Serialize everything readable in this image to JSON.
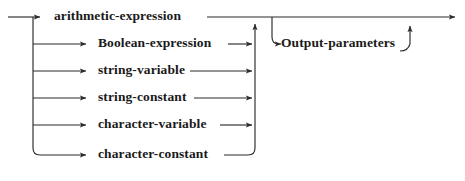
{
  "diagram": {
    "type": "railroad-syntax-diagram",
    "title": "",
    "line_color": "#2b2b2b",
    "text_color": "#1a1a1a",
    "background": "#ffffff",
    "entry": {
      "name": "entry-arrow",
      "x": 8,
      "y": 17
    },
    "exit": {
      "name": "exit-arrow",
      "x": 461,
      "y": 17
    },
    "left_rail_x": 33,
    "right_rail_x": 255,
    "alternatives": [
      {
        "label": "arithmetic-expression",
        "row_y": 17,
        "text_x": 54,
        "text_y": 10,
        "arrow_in_x": 47,
        "line_out_from": 207,
        "line_out_to": 255
      },
      {
        "label": "Boolean-expression",
        "row_y": 44,
        "text_x": 98,
        "text_y": 37,
        "arrow_in_x": 94,
        "line_out_from": 228,
        "line_out_to": 254
      },
      {
        "label": "string-variable",
        "row_y": 71,
        "text_x": 98,
        "text_y": 64,
        "arrow_in_x": 94,
        "line_out_from": 190,
        "line_out_to": 254
      },
      {
        "label": "string-constant",
        "row_y": 98,
        "text_x": 98,
        "text_y": 91,
        "arrow_in_x": 94,
        "line_out_from": 194,
        "line_out_to": 254
      },
      {
        "label": "character-variable",
        "row_y": 125,
        "text_x": 98,
        "text_y": 118,
        "arrow_in_x": 94,
        "line_out_from": 220,
        "line_out_to": 254
      },
      {
        "label": "character-constant",
        "row_y": 155,
        "text_x": 98,
        "text_y": 148,
        "arrow_in_x": 94,
        "line_out_from": 220,
        "line_out_to": 254
      }
    ],
    "optional_branch": {
      "label": "Output-parameters",
      "row_y": 44,
      "text_x": 281,
      "text_y": 37,
      "arrow_in_x": 277,
      "branch_from_x": 272,
      "line_out_from": 400,
      "rejoin_x": 418
    },
    "main_rail": {
      "top_y": 17,
      "from_x": 8,
      "to_x": 461
    }
  }
}
